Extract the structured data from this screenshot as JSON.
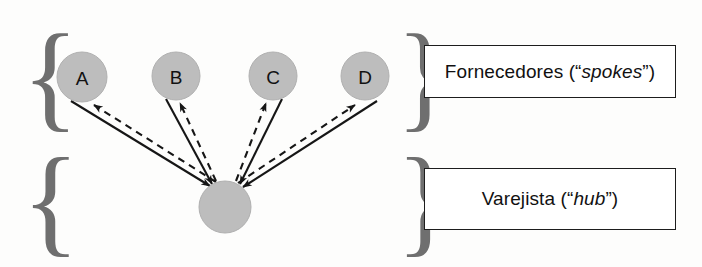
{
  "diagram": {
    "background_color": "#fdfdfc",
    "node_fill_color": "#bdbdbd",
    "node_stroke_color": "#a8a8a8",
    "edge_color": "#161616",
    "brace_color": "#6f6f6f",
    "groups": [
      {
        "key": "spokes",
        "brace_glyph_left": "{",
        "brace_glyph_right": "}",
        "label_prefix": "Fornecedores (“",
        "label_italic": "spokes",
        "label_suffix": "”)",
        "label_full": "Fornecedores (“spokes”)"
      },
      {
        "key": "hub",
        "brace_glyph_left": "{",
        "brace_glyph_right": "}",
        "label_prefix": "Varejista (“",
        "label_italic": "hub",
        "label_suffix": "”)",
        "label_full": "Varejista (“hub”)"
      }
    ],
    "nodes": [
      {
        "id": "A",
        "label": "A",
        "role": "spoke",
        "cx": 82,
        "cy": 77,
        "rx": 25,
        "ry": 25
      },
      {
        "id": "B",
        "label": "B",
        "role": "spoke",
        "cx": 176,
        "cy": 76,
        "rx": 24,
        "ry": 24
      },
      {
        "id": "C",
        "label": "C",
        "role": "spoke",
        "cx": 273,
        "cy": 76,
        "rx": 24,
        "ry": 24
      },
      {
        "id": "D",
        "label": "D",
        "role": "spoke",
        "cx": 365,
        "cy": 76,
        "rx": 24,
        "ry": 24
      },
      {
        "id": "HUB",
        "label": "",
        "role": "hub",
        "cx": 225,
        "cy": 207,
        "rx": 26,
        "ry": 26
      }
    ],
    "edges": [
      {
        "from": "A",
        "to": "HUB",
        "style": "solid",
        "direction": "spoke-to-hub"
      },
      {
        "from": "HUB",
        "to": "A",
        "style": "dashed",
        "direction": "hub-to-spoke"
      },
      {
        "from": "B",
        "to": "HUB",
        "style": "solid",
        "direction": "spoke-to-hub"
      },
      {
        "from": "HUB",
        "to": "B",
        "style": "dashed",
        "direction": "hub-to-spoke"
      },
      {
        "from": "C",
        "to": "HUB",
        "style": "solid",
        "direction": "spoke-to-hub"
      },
      {
        "from": "HUB",
        "to": "C",
        "style": "dashed",
        "direction": "hub-to-spoke"
      },
      {
        "from": "D",
        "to": "HUB",
        "style": "solid",
        "direction": "spoke-to-hub"
      },
      {
        "from": "HUB",
        "to": "D",
        "style": "dashed",
        "direction": "hub-to-spoke"
      }
    ]
  }
}
